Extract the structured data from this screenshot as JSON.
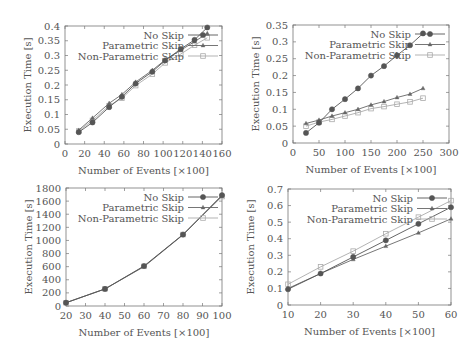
{
  "chart_data": [
    {
      "type": "line",
      "title": "",
      "xlabel": "Number of Events [×100]",
      "ylabel": "Execution Time [s]",
      "xlim": [
        0,
        160
      ],
      "ylim": [
        0,
        0.4
      ],
      "xticks": [
        0,
        20,
        40,
        60,
        80,
        100,
        120,
        140,
        160
      ],
      "yticks": [
        0,
        0.05,
        0.1,
        0.15,
        0.2,
        0.25,
        0.3,
        0.35,
        0.4
      ],
      "ytick_labels": [
        "0",
        "0.05",
        "0.1",
        "0.15",
        "0.2",
        "0.25",
        "0.3",
        "0.35",
        "0.4"
      ],
      "legend_position": "upper right",
      "grid": false,
      "x": [
        14,
        28,
        45,
        58,
        72,
        89,
        102,
        118,
        132,
        145
      ],
      "series": [
        {
          "name": "No Skip",
          "marker": "filled-circle",
          "color": "#555555",
          "values": [
            0.04,
            0.073,
            0.125,
            0.16,
            0.205,
            0.245,
            0.283,
            0.322,
            0.353,
            0.395
          ]
        },
        {
          "name": "Parametric Skip",
          "marker": "triangle",
          "color": "#666666",
          "values": [
            0.047,
            0.088,
            0.138,
            0.168,
            0.21,
            0.25,
            0.285,
            0.318,
            0.347,
            0.375
          ]
        },
        {
          "name": "Non-Parametric Skip",
          "marker": "open-square",
          "color": "#aaaaaa",
          "values": [
            0.044,
            0.08,
            0.13,
            0.155,
            0.198,
            0.237,
            0.275,
            0.305,
            0.335,
            0.36
          ]
        }
      ]
    },
    {
      "type": "line",
      "title": "",
      "xlabel": "Number of Events [×100]",
      "ylabel": "Execution Time [s]",
      "xlim": [
        0,
        300
      ],
      "ylim": [
        0,
        0.35
      ],
      "xticks": [
        0,
        50,
        100,
        150,
        200,
        250,
        300
      ],
      "yticks": [
        0,
        0.05,
        0.1,
        0.15,
        0.2,
        0.25,
        0.3,
        0.35
      ],
      "ytick_labels": [
        "0",
        "0.05",
        "0.1",
        "0.15",
        "0.2",
        "0.25",
        "0.3",
        "0.35"
      ],
      "legend_position": "upper right",
      "grid": false,
      "x": [
        25,
        50,
        75,
        100,
        125,
        150,
        175,
        200,
        225,
        250
      ],
      "series": [
        {
          "name": "No Skip",
          "marker": "filled-circle",
          "color": "#555555",
          "values": [
            0.03,
            0.06,
            0.1,
            0.13,
            0.162,
            0.2,
            0.228,
            0.26,
            0.29,
            0.325
          ]
        },
        {
          "name": "Parametric Skip",
          "marker": "triangle",
          "color": "#666666",
          "values": [
            0.058,
            0.068,
            0.08,
            0.09,
            0.1,
            0.113,
            0.123,
            0.135,
            0.145,
            0.162
          ]
        },
        {
          "name": "Non-Parametric Skip",
          "marker": "open-square",
          "color": "#aaaaaa",
          "values": [
            0.05,
            0.062,
            0.07,
            0.08,
            0.09,
            0.102,
            0.108,
            0.115,
            0.122,
            0.133
          ]
        }
      ]
    },
    {
      "type": "line",
      "title": "",
      "xlabel": "Number of Events [×100]",
      "ylabel": "Execution Time [s]",
      "xlim": [
        20,
        100
      ],
      "ylim": [
        0,
        1800
      ],
      "xticks": [
        20,
        30,
        40,
        50,
        60,
        70,
        80,
        90,
        100
      ],
      "yticks": [
        0,
        200,
        400,
        600,
        800,
        1000,
        1200,
        1400,
        1600,
        1800
      ],
      "ytick_labels": [
        "0",
        "200",
        "400",
        "600",
        "800",
        "1000",
        "1200",
        "1400",
        "1600",
        "1800"
      ],
      "legend_position": "upper right",
      "grid": false,
      "x": [
        20,
        40,
        60,
        80,
        100
      ],
      "series": [
        {
          "name": "No Skip",
          "marker": "filled-circle",
          "color": "#555555",
          "values": [
            50,
            260,
            610,
            1090,
            1690
          ]
        },
        {
          "name": "Parametric Skip",
          "marker": "triangle",
          "color": "#666666",
          "values": [
            50,
            260,
            600,
            1085,
            1680
          ]
        },
        {
          "name": "Non-Parametric Skip",
          "marker": "open-square",
          "color": "#aaaaaa",
          "values": [
            50,
            262,
            605,
            1090,
            1670
          ]
        }
      ]
    },
    {
      "type": "line",
      "title": "",
      "xlabel": "Number of Events [×100]",
      "ylabel": "Execution Time [s]",
      "xlim": [
        10,
        60
      ],
      "ylim": [
        0,
        0.7
      ],
      "xticks": [
        10,
        20,
        30,
        40,
        50,
        60
      ],
      "yticks": [
        0,
        0.1,
        0.2,
        0.3,
        0.4,
        0.5,
        0.6,
        0.7
      ],
      "ytick_labels": [
        "0",
        "0.1",
        "0.2",
        "0.3",
        "0.4",
        "0.5",
        "0.6",
        "0.7"
      ],
      "legend_position": "upper right",
      "grid": false,
      "x": [
        10,
        20,
        30,
        40,
        50,
        60
      ],
      "series": [
        {
          "name": "No Skip",
          "marker": "filled-circle",
          "color": "#555555",
          "values": [
            0.095,
            0.19,
            0.29,
            0.39,
            0.49,
            0.59
          ]
        },
        {
          "name": "Parametric Skip",
          "marker": "triangle",
          "color": "#666666",
          "values": [
            0.1,
            0.19,
            0.275,
            0.355,
            0.435,
            0.52
          ]
        },
        {
          "name": "Non-Parametric Skip",
          "marker": "open-square",
          "color": "#aaaaaa",
          "values": [
            0.125,
            0.23,
            0.325,
            0.43,
            0.53,
            0.63
          ]
        }
      ]
    }
  ],
  "layout": [
    {
      "left": 65,
      "right": 222,
      "top": 26,
      "bottom": 144
    },
    {
      "left": 293,
      "right": 449,
      "top": 25,
      "bottom": 143
    },
    {
      "left": 66,
      "right": 222,
      "top": 188,
      "bottom": 306
    },
    {
      "left": 288,
      "right": 451,
      "top": 189,
      "bottom": 305
    }
  ]
}
